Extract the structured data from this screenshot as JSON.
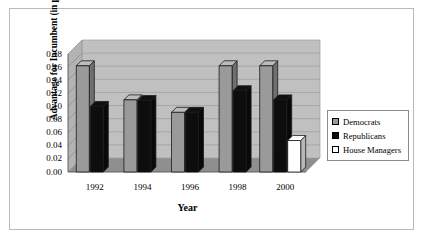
{
  "chart_data": {
    "type": "bar",
    "title": "",
    "subtitle": "",
    "xlabel": "Year",
    "ylabel": "Advantage for Incumbent (in percent)",
    "categories": [
      "1992",
      "1994",
      "1996",
      "1998",
      "2000"
    ],
    "ylim": [
      0.0,
      0.18
    ],
    "ytick_labels": [
      "0.00",
      "0.02",
      "0.04",
      "0.06",
      "0.08",
      "0.10",
      "0.12",
      "0.14",
      "0.16",
      "0.18"
    ],
    "ytick_values": [
      0.0,
      0.02,
      0.04,
      0.06,
      0.08,
      0.1,
      0.12,
      0.14,
      0.16,
      0.18
    ],
    "grid": true,
    "grid_orientation": "horizontal",
    "legend_position": "right",
    "three_d": true,
    "series": [
      {
        "name": "Democrats",
        "color": "#9a9a9a",
        "values": [
          0.162,
          0.11,
          0.091,
          0.162,
          0.162
        ]
      },
      {
        "name": "Republicans",
        "color": "#0d0d0d",
        "values": [
          0.1,
          0.109,
          0.091,
          0.124,
          0.11
        ]
      },
      {
        "name": "House Managers",
        "color": "#ffffff",
        "values": [
          null,
          null,
          null,
          null,
          0.048
        ]
      }
    ]
  },
  "legend": {
    "items": [
      {
        "label": "Democrats"
      },
      {
        "label": "Republicans"
      },
      {
        "label": "House Managers"
      }
    ]
  },
  "colors": {
    "democrats": "#9a9a9a",
    "republicans": "#0d0d0d",
    "house_managers": "#ffffff",
    "plot_wall": "#c0c0c0",
    "plot_floor": "#8f8f8f",
    "frame_border": "#b9b9b9",
    "gridline": "#9d9d9d"
  }
}
